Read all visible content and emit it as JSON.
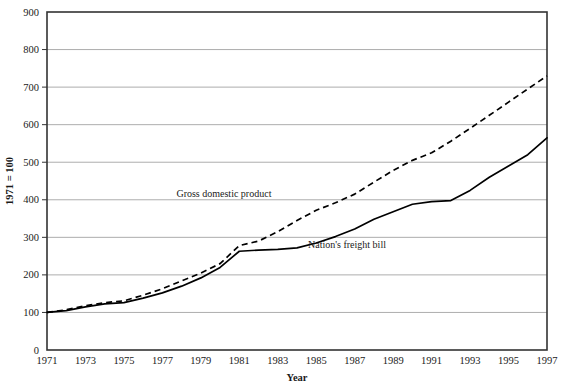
{
  "chart_data": {
    "type": "line",
    "title": "",
    "xlabel": "Year",
    "ylabel": "1971 = 100",
    "xlim": [
      1971,
      1997
    ],
    "ylim": [
      0,
      900
    ],
    "ytick_step": 100,
    "grid": true,
    "legend_position": "inline-annotations",
    "x_ticks": [
      "1971",
      "1973",
      "1975",
      "1977",
      "1979",
      "1981",
      "1983",
      "1985",
      "1987",
      "1989",
      "1991",
      "1993",
      "1995",
      "1997"
    ],
    "y_ticks": [
      "0",
      "100",
      "200",
      "300",
      "400",
      "500",
      "600",
      "700",
      "800",
      "900"
    ],
    "x": [
      1971,
      1972,
      1973,
      1974,
      1975,
      1976,
      1977,
      1978,
      1979,
      1980,
      1981,
      1982,
      1983,
      1984,
      1985,
      1986,
      1987,
      1988,
      1989,
      1990,
      1991,
      1992,
      1993,
      1994,
      1995,
      1996,
      1997
    ],
    "series": [
      {
        "name": "Gross domestic product",
        "style": "dashed",
        "color": "#000000",
        "label_x": 1980.2,
        "label_y": 408,
        "values": [
          100,
          107,
          118,
          126,
          131,
          146,
          163,
          184,
          205,
          230,
          278,
          290,
          315,
          345,
          372,
          392,
          415,
          447,
          478,
          505,
          525,
          556,
          590,
          625,
          660,
          695,
          730
        ]
      },
      {
        "name": "Nation's freight bill",
        "style": "solid",
        "color": "#000000",
        "label_x": 1986.6,
        "label_y": 272,
        "values": [
          100,
          105,
          115,
          123,
          126,
          138,
          152,
          170,
          192,
          220,
          263,
          266,
          268,
          272,
          285,
          302,
          322,
          348,
          368,
          388,
          395,
          398,
          425,
          460,
          490,
          520,
          565
        ]
      }
    ]
  }
}
